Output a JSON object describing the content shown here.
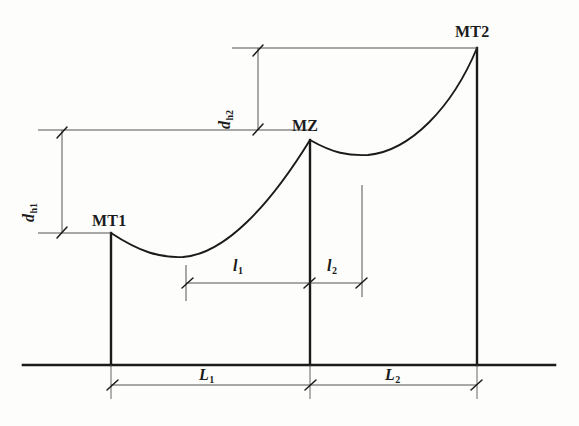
{
  "figure": {
    "type": "engineering-diagram",
    "background_color": "#fdfdfb",
    "ink_color": "#1b1b1b",
    "width": 579,
    "height": 426
  },
  "nodes": [
    {
      "id": "mt1",
      "label": "MT1",
      "label_x": 92,
      "label_y": 213,
      "top_x": 111,
      "top_y": 233,
      "base_y": 365
    },
    {
      "id": "mz",
      "label": "MZ",
      "label_x": 292,
      "label_y": 118,
      "top_x": 310,
      "top_y": 140,
      "base_y": 365
    },
    {
      "id": "mt2",
      "label": "MT2",
      "label_x": 455,
      "label_y": 24,
      "top_x": 477,
      "top_y": 48,
      "base_y": 365
    }
  ],
  "dimensions": {
    "vertical": [
      {
        "id": "dh1",
        "label": "d",
        "subscript": "h1",
        "label_x": 37,
        "label_y": 206,
        "axis_x": 62,
        "from_y": 130,
        "to_y": 233
      },
      {
        "id": "dh2",
        "label": "d",
        "subscript": "h2",
        "label_x": 233,
        "label_y": 113,
        "axis_x": 258,
        "from_y": 48,
        "to_y": 130
      }
    ],
    "horizontal_upper": [
      {
        "id": "l1",
        "label": "l",
        "subscript": "1",
        "label_x": 233,
        "label_y": 258,
        "axis_y": 283,
        "from_x": 186,
        "to_x": 310
      },
      {
        "id": "l2",
        "label": "l",
        "subscript": "2",
        "label_x": 327,
        "label_y": 258,
        "axis_y": 283,
        "from_x": 310,
        "to_x": 362
      }
    ],
    "horizontal_lower": [
      {
        "id": "L1",
        "label": "L",
        "subscript": "1",
        "label_x": 199,
        "label_y": 367,
        "axis_y": 385,
        "from_x": 111,
        "to_x": 310
      },
      {
        "id": "L2",
        "label": "L",
        "subscript": "2",
        "label_x": 385,
        "label_y": 367,
        "axis_y": 385,
        "from_x": 310,
        "to_x": 477
      }
    ]
  },
  "reference_lines": [
    {
      "id": "ref-top",
      "y": 48,
      "from_x": 232,
      "to_x": 477
    },
    {
      "id": "ref-middle",
      "y": 130,
      "from_x": 38,
      "to_x": 310
    },
    {
      "id": "ref-lower",
      "y": 233,
      "from_x": 38,
      "to_x": 111
    }
  ],
  "ground_line": {
    "y": 365,
    "from_x": 23,
    "to_x": 555
  },
  "conductor_spans": [
    {
      "id": "span-1",
      "from": "mt1",
      "to": "mz",
      "sag_low_x": 178,
      "sag_low_y": 258
    },
    {
      "id": "span-2",
      "from": "mz",
      "to": "mt2",
      "sag_low_x": 362,
      "sag_low_y": 156
    }
  ]
}
